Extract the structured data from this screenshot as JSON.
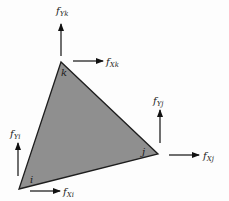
{
  "diagram": {
    "type": "triangular-element-nodal-forces",
    "element": {
      "fill": "#8f8f8f",
      "stroke": "#1e1e1e",
      "nodes": [
        {
          "id": "i",
          "label": "i",
          "x": 19,
          "y": 189
        },
        {
          "id": "j",
          "label": "j",
          "x": 158,
          "y": 154
        },
        {
          "id": "k",
          "label": "k",
          "x": 61,
          "y": 62
        }
      ]
    },
    "forces": [
      {
        "id": "fYk",
        "base": "f",
        "sub1": "Y",
        "sub2": "k",
        "direction": "up"
      },
      {
        "id": "fXk",
        "base": "f",
        "sub1": "X",
        "sub2": "k",
        "direction": "right"
      },
      {
        "id": "fYj",
        "base": "f",
        "sub1": "Y",
        "sub2": "j",
        "direction": "up"
      },
      {
        "id": "fXj",
        "base": "f",
        "sub1": "X",
        "sub2": "j",
        "direction": "right"
      },
      {
        "id": "fYi",
        "base": "f",
        "sub1": "Y",
        "sub2": "i",
        "direction": "up"
      },
      {
        "id": "fXi",
        "base": "f",
        "sub1": "X",
        "sub2": "i",
        "direction": "right"
      }
    ]
  }
}
